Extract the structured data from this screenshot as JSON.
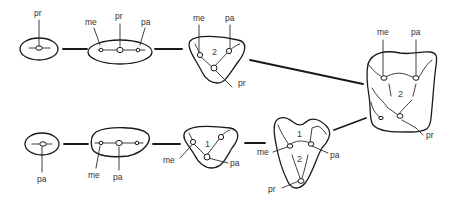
{
  "diagram": {
    "top_row": {
      "stage1": {
        "labels": [
          "pr"
        ]
      },
      "stage2": {
        "labels": [
          "me",
          "pr",
          "pa"
        ]
      },
      "stage3": {
        "labels": [
          "me",
          "pa",
          "pr"
        ],
        "number": "2"
      }
    },
    "bottom_row": {
      "stage1": {
        "labels": [
          "pa"
        ]
      },
      "stage2": {
        "labels": [
          "me",
          "pa"
        ]
      },
      "stage3": {
        "labels": [
          "me",
          "pa"
        ],
        "number": "1"
      },
      "stage4": {
        "labels": [
          "me",
          "pa",
          "pr"
        ],
        "numbers": [
          "1",
          "2"
        ]
      }
    },
    "final": {
      "labels": [
        "me",
        "pa",
        "pr"
      ],
      "number": "2"
    }
  },
  "labels": {
    "pr": "pr",
    "me": "me",
    "pa": "pa",
    "one": "1",
    "two": "2"
  }
}
